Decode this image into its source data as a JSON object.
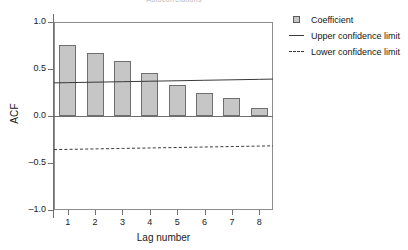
{
  "chart_data": {
    "type": "bar",
    "title": "Autocorrelations",
    "xlabel": "Lag number",
    "ylabel": "ACF",
    "categories": [
      "1",
      "2",
      "3",
      "4",
      "5",
      "6",
      "7",
      "8"
    ],
    "values": [
      0.76,
      0.67,
      0.58,
      0.46,
      0.33,
      0.24,
      0.19,
      0.08
    ],
    "series": [
      {
        "name": "Coefficient",
        "type": "bar",
        "values": [
          0.76,
          0.67,
          0.58,
          0.46,
          0.33,
          0.24,
          0.19,
          0.08
        ]
      },
      {
        "name": "Upper confidence limit",
        "type": "line",
        "style": "solid",
        "values": [
          0.355,
          0.36,
          0.365,
          0.37,
          0.375,
          0.38,
          0.385,
          0.39
        ]
      },
      {
        "name": "Lower confidence limit",
        "type": "line",
        "style": "dashed",
        "values": [
          -0.355,
          -0.35,
          -0.345,
          -0.34,
          -0.335,
          -0.33,
          -0.325,
          -0.32
        ]
      }
    ],
    "ylim": [
      -1.0,
      1.0
    ],
    "yticks": [
      "1.0",
      "0.5",
      "0.0",
      "-0.5",
      "-1.0"
    ],
    "ytick_values": [
      1.0,
      0.5,
      0.0,
      -0.5,
      -1.0
    ],
    "xlim": [
      0.5,
      8.5
    ],
    "grid": false,
    "legend_position": "right",
    "legend": [
      "Coefficient",
      "Upper confidence limit",
      "Lower confidence limit"
    ],
    "colors": {
      "bar_fill": "#c6c6c6",
      "bar_border": "#6e6e6e",
      "confidence_line": "#3a3a3a",
      "axis": "#6f6f6f",
      "text": "#141414"
    }
  },
  "legend": {
    "items": [
      {
        "label": "Coefficient",
        "key": "swatch-icon"
      },
      {
        "label": "Upper confidence limit",
        "key": "solid-line-icon"
      },
      {
        "label": "Lower confidence limit",
        "key": "dashed-line-icon"
      }
    ]
  }
}
